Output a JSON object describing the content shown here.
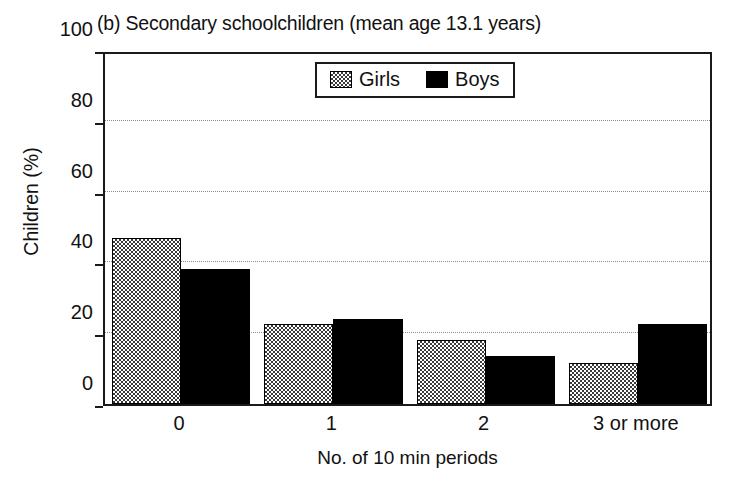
{
  "chart_data": {
    "type": "bar",
    "title": "(b) Secondary schoolchildren (mean age 13.1 years)",
    "xlabel": "No. of 10 min periods",
    "ylabel": "Children (%)",
    "categories": [
      "0",
      "1",
      "2",
      "3 or more"
    ],
    "series": [
      {
        "name": "Girls",
        "values": [
          47,
          22.5,
          18,
          11.5
        ],
        "color": "#3a3a3a",
        "pattern": "checkered"
      },
      {
        "name": "Boys",
        "values": [
          38,
          24,
          13.5,
          22.5
        ],
        "color": "#000000",
        "pattern": "solid"
      }
    ],
    "ylim": [
      0,
      100
    ],
    "ytick_labels": [
      "0",
      "20",
      "40",
      "60",
      "80",
      "100"
    ],
    "ytick_values": [
      0,
      20,
      40,
      60,
      80,
      100
    ],
    "gridlines": [
      20,
      40,
      60,
      80
    ],
    "grid": true,
    "grid_style": "dotted",
    "legend_position": "top-center",
    "legend_entries": [
      "Girls",
      "Boys"
    ]
  },
  "axis_colors": {
    "frame": "#1a1a1a",
    "grid": "#8d8d8d",
    "text": "#111111"
  }
}
